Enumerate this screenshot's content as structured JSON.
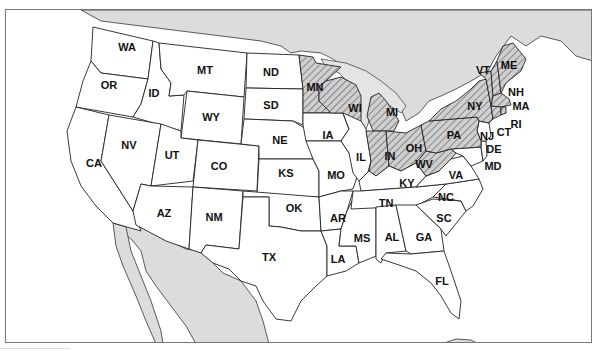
{
  "title": {
    "text": "",
    "note": "clipped"
  },
  "colors": {
    "shaded_fill": "#c8c8c8",
    "hatch_line": "#555555",
    "foreign_land": "#dcdcdc",
    "state_fill": "#ffffff",
    "border": "#222222"
  },
  "legend": {
    "shaded_meaning": "hatched states"
  },
  "states": [
    {
      "abbr": "WA",
      "shaded": false
    },
    {
      "abbr": "OR",
      "shaded": false
    },
    {
      "abbr": "CA",
      "shaded": false
    },
    {
      "abbr": "ID",
      "shaded": false
    },
    {
      "abbr": "NV",
      "shaded": false
    },
    {
      "abbr": "MT",
      "shaded": false
    },
    {
      "abbr": "WY",
      "shaded": false
    },
    {
      "abbr": "UT",
      "shaded": false
    },
    {
      "abbr": "AZ",
      "shaded": false
    },
    {
      "abbr": "CO",
      "shaded": false
    },
    {
      "abbr": "NM",
      "shaded": false
    },
    {
      "abbr": "ND",
      "shaded": false
    },
    {
      "abbr": "SD",
      "shaded": false
    },
    {
      "abbr": "NE",
      "shaded": false
    },
    {
      "abbr": "KS",
      "shaded": false
    },
    {
      "abbr": "OK",
      "shaded": false
    },
    {
      "abbr": "TX",
      "shaded": false
    },
    {
      "abbr": "MN",
      "shaded": true
    },
    {
      "abbr": "IA",
      "shaded": false
    },
    {
      "abbr": "MO",
      "shaded": false
    },
    {
      "abbr": "AR",
      "shaded": false
    },
    {
      "abbr": "LA",
      "shaded": false
    },
    {
      "abbr": "WI",
      "shaded": true
    },
    {
      "abbr": "IL",
      "shaded": false
    },
    {
      "abbr": "MS",
      "shaded": false
    },
    {
      "abbr": "MI",
      "shaded": true
    },
    {
      "abbr": "IN",
      "shaded": true
    },
    {
      "abbr": "KY",
      "shaded": false
    },
    {
      "abbr": "TN",
      "shaded": false
    },
    {
      "abbr": "AL",
      "shaded": false
    },
    {
      "abbr": "OH",
      "shaded": true
    },
    {
      "abbr": "WV",
      "shaded": true
    },
    {
      "abbr": "VA",
      "shaded": false
    },
    {
      "abbr": "NC",
      "shaded": false
    },
    {
      "abbr": "SC",
      "shaded": false
    },
    {
      "abbr": "GA",
      "shaded": false
    },
    {
      "abbr": "FL",
      "shaded": false
    },
    {
      "abbr": "PA",
      "shaded": true
    },
    {
      "abbr": "NY",
      "shaded": true
    },
    {
      "abbr": "VT",
      "shaded": true
    },
    {
      "abbr": "NH",
      "shaded": true
    },
    {
      "abbr": "ME",
      "shaded": true
    },
    {
      "abbr": "MA",
      "shaded": true
    },
    {
      "abbr": "CT",
      "shaded": true
    },
    {
      "abbr": "RI",
      "shaded": true
    },
    {
      "abbr": "NJ",
      "shaded": false
    },
    {
      "abbr": "DE",
      "shaded": false
    },
    {
      "abbr": "MD",
      "shaded": false
    }
  ],
  "labels": {
    "WA": "WA",
    "OR": "OR",
    "CA": "CA",
    "ID": "ID",
    "NV": "NV",
    "MT": "MT",
    "WY": "WY",
    "UT": "UT",
    "AZ": "AZ",
    "CO": "CO",
    "NM": "NM",
    "ND": "ND",
    "SD": "SD",
    "NE": "NE",
    "KS": "KS",
    "OK": "OK",
    "TX": "TX",
    "MN": "MN",
    "IA": "IA",
    "MO": "MO",
    "AR": "AR",
    "LA": "LA",
    "WI": "WI",
    "IL": "IL",
    "MS": "MS",
    "MI": "MI",
    "IN": "IN",
    "KY": "KY",
    "TN": "TN",
    "AL": "AL",
    "OH": "OH",
    "WV": "WV",
    "VA": "VA",
    "NC": "NC",
    "SC": "SC",
    "GA": "GA",
    "FL": "FL",
    "PA": "PA",
    "NY": "NY",
    "VT": "VT",
    "NH": "NH",
    "ME": "ME",
    "MA": "MA",
    "CT": "CT",
    "RI": "RI",
    "NJ": "NJ",
    "DE": "DE",
    "MD": "MD"
  }
}
